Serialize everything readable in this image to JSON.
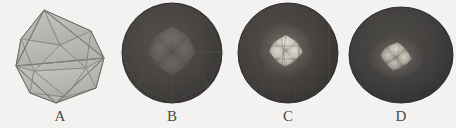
{
  "figure": {
    "background_color": "#f3f2f0",
    "width": 456,
    "height": 128,
    "caption_font_color": "#4a4845"
  },
  "panels": [
    {
      "label": "A",
      "name": "icosahedron",
      "description": "semi-transparent wireframe icosahedron",
      "render_style": "wireframe",
      "face_count": 20,
      "subdivision_level": 0,
      "fill_color": "#b4b2ae",
      "edge_color": "#6e6c68",
      "highlight_color": "#c9c7c2"
    },
    {
      "label": "B",
      "name": "geodesic-sphere-level-1",
      "description": "faceted sphere with coarse triangular mesh and broad central highlight",
      "render_style": "faceted-shaded",
      "subdivision_level": 1,
      "fill_color": "#474543",
      "edge_color": "#56534f",
      "highlight_color": "#6c6864",
      "rim_color": "#3a3836"
    },
    {
      "label": "C",
      "name": "geodesic-sphere-level-2",
      "description": "faceted sphere with fine triangular mesh and bright specular highlight",
      "render_style": "faceted-shaded",
      "subdivision_level": 2,
      "fill_color": "#454341",
      "edge_color": "#514e4b",
      "highlight_color": "#d8d4cb",
      "rim_color": "#383634"
    },
    {
      "label": "D",
      "name": "geodesic-sphere-level-3",
      "description": "near-smooth sphere with soft off-center specular highlight",
      "render_style": "smooth-shaded",
      "subdivision_level": 3,
      "fill_color": "#434140",
      "edge_color": "#4b4947",
      "highlight_color": "#cfcbc2",
      "rim_color": "#353332"
    }
  ]
}
